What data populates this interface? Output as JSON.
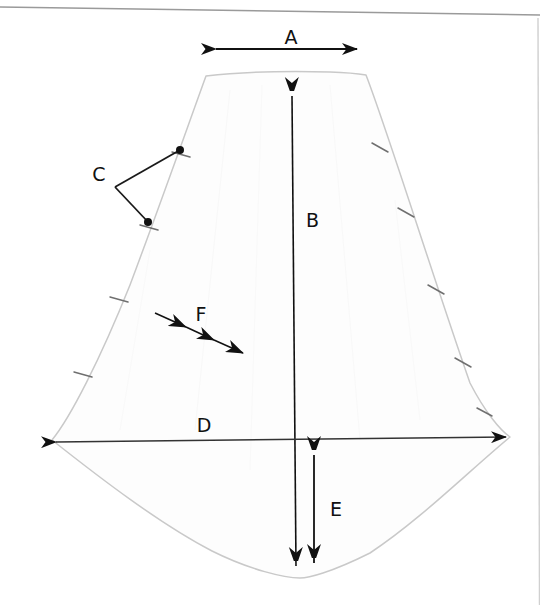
{
  "document": {
    "kind": "scanned-technical-drawing",
    "title": "Sail panel dimension diagram",
    "background_color": "#ffffff",
    "page_width": 540,
    "page_height": 605
  },
  "scan_artifacts": {
    "top_edge_line": {
      "name": "page-top-edge-line",
      "color": "#9a9a9a",
      "x1": 0,
      "y1": 7,
      "x2": 540,
      "y2": 15
    },
    "right_edge_line": {
      "name": "page-right-edge-line",
      "color": "#c8c8c8",
      "x1": 537,
      "y1": 15,
      "x2": 539,
      "y2": 605
    }
  },
  "shape": {
    "name": "sail-outline",
    "fill_color": "#fdfdfd",
    "stroke_color": "#c9c9c9",
    "stroke_width": 1.4,
    "description": "Kite / sail shaped panel: flat narrow top, two straight sloping sides flaring outward, wide curved bottom",
    "top_left": [
      206,
      76
    ],
    "top_right": [
      366,
      75
    ],
    "left_corner": [
      52,
      440
    ],
    "right_corner": [
      510,
      437
    ],
    "bottom_center": [
      300,
      578
    ]
  },
  "seam_ticks": {
    "name": "seam-tick-marks",
    "color": "#6f6f6f",
    "left_edge_count": 4,
    "right_edge_count": 5
  },
  "dimensions": [
    {
      "key": "A",
      "label": "A",
      "name": "dimension-a",
      "type": "double-arrow-horizontal",
      "measures": "top width",
      "label_x": 291,
      "label_y": 44,
      "x1": 214,
      "y1": 49,
      "x2": 359,
      "y2": 49
    },
    {
      "key": "B",
      "label": "B",
      "name": "dimension-b",
      "type": "double-arrow-vertical",
      "measures": "overall height on centerline",
      "label_x": 306,
      "label_y": 227,
      "x1": 291,
      "y1": 80,
      "x2": 296,
      "y2": 578
    },
    {
      "key": "C",
      "label": "C",
      "name": "dimension-c",
      "type": "leader-lines-two-points",
      "measures": "seam tick positions on left edge",
      "label_x": 98,
      "label_y": 180,
      "elbow": [
        115,
        187
      ],
      "point_1": [
        180,
        150
      ],
      "point_2": [
        148,
        222
      ]
    },
    {
      "key": "D",
      "label": "D",
      "name": "dimension-d",
      "type": "double-arrow-horizontal",
      "measures": "maximum width",
      "label_x": 203,
      "label_y": 431,
      "x1": 52,
      "y1": 442,
      "x2": 510,
      "y2": 437
    },
    {
      "key": "E",
      "label": "E",
      "name": "dimension-e",
      "type": "double-arrow-vertical",
      "measures": "depth of bottom curve below widest point",
      "label_x": 329,
      "label_y": 515,
      "x1": 314,
      "y1": 440,
      "x2": 314,
      "y2": 576
    },
    {
      "key": "F",
      "label": "F",
      "name": "dimension-f",
      "type": "multi-arrowhead-diagonal",
      "measures": "direction indicator / grain or airflow",
      "label_x": 200,
      "label_y": 320,
      "x1": 155,
      "y1": 313,
      "x2": 243,
      "y2": 353,
      "arrowhead_count": 3
    }
  ],
  "ink": {
    "annotation_color": "#111111",
    "leader_color": "#222222"
  }
}
